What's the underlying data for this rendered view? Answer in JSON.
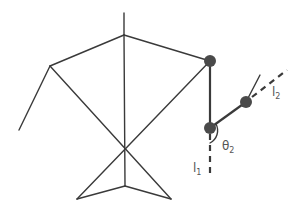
{
  "diagram": {
    "type": "stick-figure kinematic diagram",
    "labels": {
      "l1": {
        "base": "l",
        "sub": "1"
      },
      "l2": {
        "base": "l",
        "sub": "2"
      },
      "theta2": {
        "base": "θ",
        "sub": "2"
      }
    },
    "colors": {
      "line": "#3a3a3a",
      "joint": "#4a4a4a",
      "label": "#555555"
    }
  }
}
